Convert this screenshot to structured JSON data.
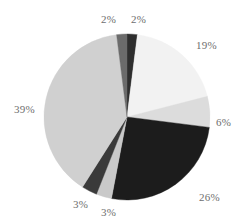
{
  "chart_data": {
    "type": "pie",
    "title": "",
    "subtitle": "",
    "xlabel": "",
    "ylabel": "",
    "legend": "none",
    "grid": false,
    "labels_shown": "percent",
    "categories": [
      "Segment 1",
      "Segment 2",
      "Segment 3",
      "Segment 4",
      "Segment 5",
      "Segment 6",
      "Segment 7",
      "Segment 8"
    ],
    "values": [
      2,
      19,
      6,
      26,
      3,
      3,
      39,
      2
    ],
    "slices": [
      {
        "label": "2%",
        "value": 2,
        "color": "#2e2e2e",
        "start_angle": 0,
        "end_angle": 7.2,
        "label_x": 131,
        "label_y": 14
      },
      {
        "label": "19%",
        "value": 19,
        "color": "#f2f2f2",
        "start_angle": 7.2,
        "end_angle": 75.6,
        "label_x": 196,
        "label_y": 40
      },
      {
        "label": "6%",
        "value": 6,
        "color": "#dcdcdc",
        "start_angle": 75.6,
        "end_angle": 97.2,
        "label_x": 216,
        "label_y": 117
      },
      {
        "label": "26%",
        "value": 26,
        "color": "#1c1c1c",
        "start_angle": 97.2,
        "end_angle": 190.8,
        "label_x": 199,
        "label_y": 192
      },
      {
        "label": "3%",
        "value": 3,
        "color": "#c9c9c9",
        "start_angle": 190.8,
        "end_angle": 201.6,
        "label_x": 101,
        "label_y": 207
      },
      {
        "label": "3%",
        "value": 3,
        "color": "#3a3a3a",
        "start_angle": 201.6,
        "end_angle": 212.4,
        "label_x": 73,
        "label_y": 199
      },
      {
        "label": "39%",
        "value": 39,
        "color": "#d0d0d0",
        "start_angle": 212.4,
        "end_angle": 352.8,
        "label_x": 14,
        "label_y": 104
      },
      {
        "label": "2%",
        "value": 2,
        "color": "#6b6b6b",
        "start_angle": 352.8,
        "end_angle": 360,
        "label_x": 101,
        "label_y": 14
      }
    ],
    "geometry": {
      "center_x": 127,
      "center_y": 117,
      "radius": 83
    },
    "total": 100,
    "background_color": "#ffffff",
    "label_color": "#6e6e6e"
  }
}
